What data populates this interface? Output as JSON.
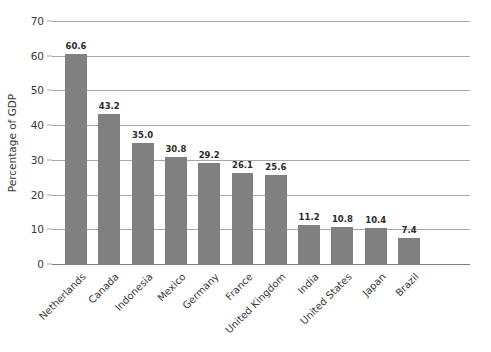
{
  "chart_data": {
    "type": "bar",
    "title": "",
    "subtitle": "",
    "xlabel": "",
    "ylabel": "Percentage of GDP",
    "ylim": [
      0,
      70
    ],
    "ytick_step": 10,
    "yticks": [
      0,
      10,
      20,
      30,
      40,
      50,
      60,
      70
    ],
    "ytick_labels": [
      "0",
      "10",
      "20",
      "30",
      "40",
      "50",
      "60",
      "70"
    ],
    "grid": "horizontal",
    "legend": "none",
    "bar_color": "#808080",
    "gridline_color": "#a9a9a9",
    "axis_color": "#808080",
    "background": "#ffffff",
    "xtick_label_rotation": -45,
    "categories": [
      "Netherlands",
      "Canada",
      "Indonesia",
      "Mexico",
      "Germany",
      "France",
      "United Kingdom",
      "India",
      "United States",
      "Japan",
      "Brazil"
    ],
    "values": [
      60.6,
      43.2,
      35.0,
      30.8,
      29.2,
      26.1,
      25.6,
      11.2,
      10.8,
      10.4,
      7.4
    ],
    "value_labels": [
      "60.6",
      "43.2",
      "35.0",
      "30.8",
      "29.2",
      "26.1",
      "25.6",
      "11.2",
      "10.8",
      "10.4",
      "7.4"
    ]
  }
}
